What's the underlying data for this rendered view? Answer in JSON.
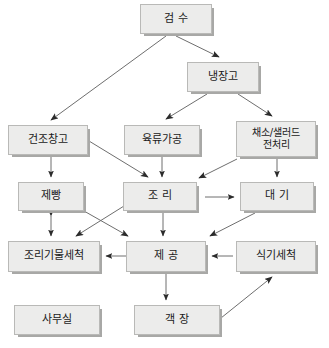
{
  "diagram": {
    "type": "flowchart",
    "background_color": "#ffffff",
    "node_fill_color": "#ececeb",
    "node_border_color": "#b9b9b7",
    "node_shadow_color": "#a8a8a6",
    "edge_color": "#6e6e6e",
    "nodes": [
      {
        "id": "n1",
        "label": "검 수",
        "x": 140,
        "y": 4,
        "w": 72,
        "h": 30,
        "size": "t11"
      },
      {
        "id": "n2",
        "label": "냉장고",
        "x": 187,
        "y": 62,
        "w": 72,
        "h": 30,
        "size": "t11"
      },
      {
        "id": "n3",
        "label": "건조창고",
        "x": 8,
        "y": 125,
        "w": 80,
        "h": 30,
        "size": "t11"
      },
      {
        "id": "n4",
        "label": "육류가공",
        "x": 124,
        "y": 125,
        "w": 76,
        "h": 30,
        "size": "t11"
      },
      {
        "id": "n5",
        "label": "채소/샐러드\n전처리",
        "x": 236,
        "y": 121,
        "w": 80,
        "h": 36,
        "size": "t10"
      },
      {
        "id": "n6",
        "label": "제빵",
        "x": 18,
        "y": 182,
        "w": 66,
        "h": 29,
        "size": "t11"
      },
      {
        "id": "n7",
        "label": "조 리",
        "x": 123,
        "y": 182,
        "w": 74,
        "h": 29,
        "size": "t11"
      },
      {
        "id": "n8",
        "label": "대 기",
        "x": 240,
        "y": 182,
        "w": 74,
        "h": 29,
        "size": "t11"
      },
      {
        "id": "n9",
        "label": "조리기물세척",
        "x": 8,
        "y": 241,
        "w": 92,
        "h": 31,
        "size": "t11"
      },
      {
        "id": "n10",
        "label": "제 공",
        "x": 126,
        "y": 241,
        "w": 80,
        "h": 31,
        "size": "t11"
      },
      {
        "id": "n11",
        "label": "식기세척",
        "x": 236,
        "y": 241,
        "w": 80,
        "h": 31,
        "size": "t11"
      },
      {
        "id": "n12",
        "label": "사무실",
        "x": 14,
        "y": 305,
        "w": 86,
        "h": 30,
        "size": "t11"
      },
      {
        "id": "n13",
        "label": "객 장",
        "x": 134,
        "y": 305,
        "w": 86,
        "h": 30,
        "size": "t11"
      }
    ],
    "edges": [
      {
        "from": "검 수",
        "to": "건조창고",
        "kind": "diagonal-down-left"
      },
      {
        "from": "검 수",
        "to": "냉장고",
        "kind": "diagonal-down-right"
      },
      {
        "from": "냉장고",
        "to": "육류가공",
        "kind": "diagonal-down-left"
      },
      {
        "from": "냉장고",
        "to": "채소/샐러드 전처리",
        "kind": "diagonal-down-right"
      },
      {
        "from": "건조창고",
        "to": "제빵",
        "kind": "vertical-down"
      },
      {
        "from": "건조창고",
        "to": "조 리",
        "kind": "diagonal-down-right"
      },
      {
        "from": "육류가공",
        "to": "조 리",
        "kind": "vertical-down"
      },
      {
        "from": "채소/샐러드 전처리",
        "to": "조 리",
        "kind": "diagonal-down-left"
      },
      {
        "from": "채소/샐러드 전처리",
        "to": "대 기",
        "kind": "vertical-down"
      },
      {
        "from": "제빵",
        "to": "조리기물세척",
        "kind": "vertical-bidirectional"
      },
      {
        "from": "제빵",
        "to": "제 공",
        "kind": "diagonal-down-right"
      },
      {
        "from": "조 리",
        "to": "대 기",
        "kind": "horizontal-right"
      },
      {
        "from": "조 리",
        "to": "조리기물세척",
        "kind": "diagonal-down-left"
      },
      {
        "from": "조 리",
        "to": "제 공",
        "kind": "vertical-down"
      },
      {
        "from": "대 기",
        "to": "제 공",
        "kind": "diagonal-down-left"
      },
      {
        "from": "식기세척",
        "to": "제 공",
        "kind": "horizontal-left"
      },
      {
        "from": "제 공",
        "to": "조리기물세척",
        "kind": "horizontal-left"
      },
      {
        "from": "제 공",
        "to": "객 장",
        "kind": "vertical-down"
      },
      {
        "from": "객 장",
        "to": "식기세척",
        "kind": "diagonal-up-right"
      }
    ]
  }
}
